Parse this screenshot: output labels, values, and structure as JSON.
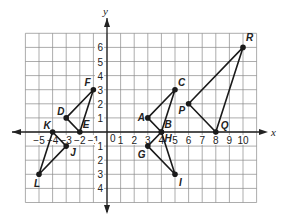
{
  "figure": {
    "type": "coordinate-plane",
    "x_axis_label": "x",
    "y_axis_label": "y",
    "origin_label": "0",
    "grid": {
      "x_min": -6,
      "x_max": 11,
      "y_min": -5,
      "y_max": 7
    },
    "x_ticks": [
      {
        "v": -5,
        "t": "−5"
      },
      {
        "v": -4,
        "t": "−4"
      },
      {
        "v": -3,
        "t": "−3"
      },
      {
        "v": -2,
        "t": "−2"
      },
      {
        "v": -1,
        "t": "−1"
      },
      {
        "v": 1,
        "t": "1"
      },
      {
        "v": 2,
        "t": "2"
      },
      {
        "v": 3,
        "t": "3"
      },
      {
        "v": 4,
        "t": "4"
      },
      {
        "v": 5,
        "t": "5"
      },
      {
        "v": 6,
        "t": "6"
      },
      {
        "v": 7,
        "t": "7"
      },
      {
        "v": 8,
        "t": "8"
      },
      {
        "v": 9,
        "t": "9"
      },
      {
        "v": 10,
        "t": "10"
      }
    ],
    "y_ticks": [
      {
        "v": 6,
        "t": "6"
      },
      {
        "v": 5,
        "t": "5"
      },
      {
        "v": 4,
        "t": "4"
      },
      {
        "v": 3,
        "t": "3"
      },
      {
        "v": 2,
        "t": "2"
      },
      {
        "v": 1,
        "t": "1"
      },
      {
        "v": -1,
        "t": "1"
      },
      {
        "v": -2,
        "t": "2"
      },
      {
        "v": -3,
        "t": "3"
      },
      {
        "v": -4,
        "t": "4"
      }
    ],
    "triangles": [
      {
        "name": "DEF",
        "vertices": [
          {
            "label": "D",
            "x": -3,
            "y": 1,
            "dx": -9,
            "dy": -3
          },
          {
            "label": "E",
            "x": -2,
            "y": 0,
            "dx": 3,
            "dy": -4
          },
          {
            "label": "F",
            "x": -1,
            "y": 3,
            "dx": -9,
            "dy": -4
          }
        ]
      },
      {
        "name": "JKL",
        "vertices": [
          {
            "label": "K",
            "x": -4,
            "y": 0,
            "dx": -9,
            "dy": -3
          },
          {
            "label": "J",
            "x": -3,
            "y": -1,
            "dx": 4,
            "dy": 10
          },
          {
            "label": "L",
            "x": -5,
            "y": -3,
            "dx": -5,
            "dy": 13
          }
        ]
      },
      {
        "name": "ABC",
        "vertices": [
          {
            "label": "A",
            "x": 3,
            "y": 1,
            "dx": -10,
            "dy": 3
          },
          {
            "label": "B",
            "x": 4,
            "y": 0,
            "dx": 3,
            "dy": -4
          },
          {
            "label": "C",
            "x": 5,
            "y": 3,
            "dx": 3,
            "dy": -4
          }
        ]
      },
      {
        "name": "GHI",
        "vertices": [
          {
            "label": "H",
            "x": 4,
            "y": 0,
            "dx": 3,
            "dy": 10
          },
          {
            "label": "G",
            "x": 3,
            "y": -1,
            "dx": -10,
            "dy": 12
          },
          {
            "label": "I",
            "x": 5,
            "y": -3,
            "dx": 4,
            "dy": 12
          }
        ]
      },
      {
        "name": "PQR",
        "vertices": [
          {
            "label": "P",
            "x": 6,
            "y": 2,
            "dx": -10,
            "dy": 10
          },
          {
            "label": "Q",
            "x": 8,
            "y": 0,
            "dx": 5,
            "dy": -3
          },
          {
            "label": "R",
            "x": 10,
            "y": 6,
            "dx": 3,
            "dy": -6
          }
        ]
      }
    ]
  },
  "header": {
    "caption": ""
  }
}
